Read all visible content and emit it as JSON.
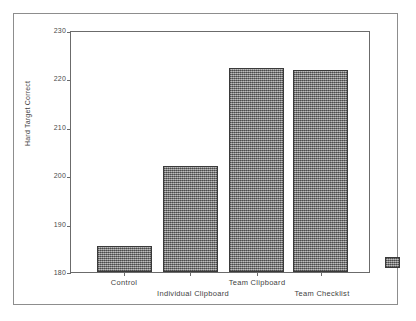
{
  "chart_data": {
    "type": "bar",
    "title": "",
    "subtitle": "",
    "xlabel": "",
    "ylabel": "Hard Target Correct",
    "categories": [
      "Control",
      "Individual Clipboard",
      "Team Clipboard",
      "Team Checklist"
    ],
    "values": [
      185.5,
      202.0,
      222.5,
      222.0
    ],
    "ylim": [
      180,
      230
    ],
    "yticks": [
      180,
      190,
      200,
      210,
      220,
      230
    ],
    "ytick_labels": [
      "180",
      "190",
      "200",
      "210",
      "220",
      "230"
    ],
    "grid": false,
    "legend": false,
    "legend_position": "none",
    "bar_fill_color": "#8a8a8a",
    "bar_border_color": "#3a3a3a",
    "axis_color": "#6b6b6b",
    "frame_color": "#8d8d8d",
    "background_color": "#ffffff",
    "annotations": []
  },
  "figure": {
    "yaxis_title": "Hard Target Correct",
    "ytick_labels": [
      "230",
      "220",
      "210",
      "200",
      "190",
      "180"
    ],
    "xaxis_labels": [
      {
        "label": "Control",
        "row": 0
      },
      {
        "label": "Individual Clipboard",
        "row": 1
      },
      {
        "label": "Team Clipboard",
        "row": 0
      },
      {
        "label": "Team Checklist",
        "row": 1
      }
    ],
    "legend_swatch_label": ""
  }
}
